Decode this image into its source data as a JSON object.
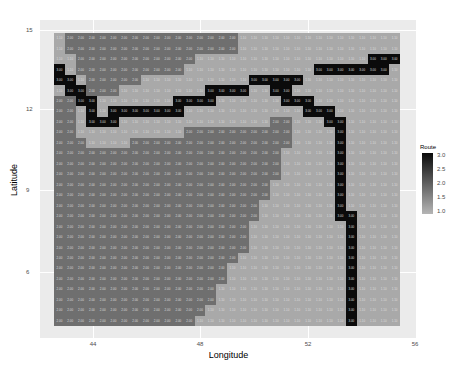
{
  "chart_data": {
    "type": "heatmap",
    "title": "",
    "xlabel": "Longitude",
    "ylabel": "Latitude",
    "x_ticks": [
      44,
      48,
      52,
      56
    ],
    "y_ticks": [
      15,
      12,
      9,
      6
    ],
    "xlim": [
      42.5,
      56
    ],
    "ylim": [
      3.8,
      15.5
    ],
    "legend": {
      "title": "Route",
      "ticks": [
        "3.0",
        "2.5",
        "2.0",
        "1.5",
        "1.0"
      ],
      "min": 1.0,
      "max": 3.0,
      "low_color": "#b5b5b5",
      "high_color": "#0a0a0a"
    },
    "colors": {
      "1": "#a9a9a9",
      "2": "#6f6f6f",
      "3": "#0b0b0b"
    },
    "labels": {
      "1": "1.10",
      "2": "2.00",
      "3": "3.00"
    },
    "grid_note": "rows top (lat ~15) to bottom (lat ~4), columns left (lon ~43) to right (lon ~56); value 3 = route cells",
    "rows": [
      "12222222222222222111111111111111",
      "12222222222222222111111111111111",
      "11222222222221111111111111111333",
      "31222222222211111111111133333331",
      "33122222111111111133333111111111",
      "13322211111111333311331111111111",
      "22331111111333311111133311111111",
      "22131333333311111111111333111111",
      "22133311111111111111221113311111",
      "22111111111122222222221111311111",
      "22211112222222222222221111311111",
      "22222222222222222222211111311111",
      "22222222222222222222211111311111",
      "22222222222222222222211111311111",
      "22222222222222222222111111311111",
      "22222222222222222222111111311111",
      "22222222222222222221111111311111",
      "22222222222222222221111111331111",
      "22222222222222222211111111131111",
      "22222222222222222211111111131111",
      "22222222222222222211111111131111",
      "22222222222222222111111111131111",
      "22222222222222221111111111131111",
      "22222222222222221111111111131111",
      "22222222222222211111111111131111",
      "22222222222222211111111111131111",
      "22222222222222111111111111131111",
      "22222222222221111111111111131111"
    ]
  }
}
